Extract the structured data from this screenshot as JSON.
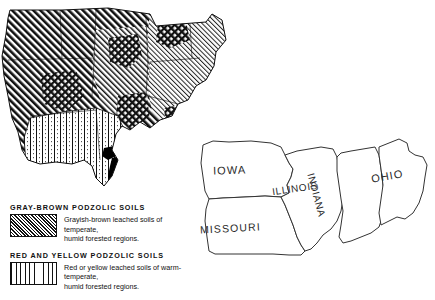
{
  "figure": {
    "kind": "soil-distribution-map",
    "ink_color": "#111111",
    "background_color": "#ffffff"
  },
  "main_map": {
    "name": "eastern-united-states-soil-map",
    "regions": [
      {
        "id": "gray-brown-podzolic",
        "pattern": "diagonal-hatch",
        "description": "dense diagonal hatching covering the upper midwest, great lakes, ohio valley, appalachian and northeastern area"
      },
      {
        "id": "red-yellow-podzolic",
        "pattern": "vertical-dotted-lines",
        "description": "vertical dotted line pattern covering the lower mississippi valley and southern area"
      },
      {
        "id": "alluvial-dark",
        "pattern": "solid-black",
        "description": "solid black strip along the lower mississippi river"
      }
    ]
  },
  "legend": {
    "entries": [
      {
        "heading": "GRAY-BROWN PODZOLIC  SOILS",
        "swatch": "diagonal-hatch-swatch",
        "line1": "Grayish-brown  leached  soils  of  temperate,",
        "line2": "humid  forested  regions."
      },
      {
        "heading": "RED  AND  YELLOW PODZOLIC SOILS",
        "swatch": "vertical-dotted-swatch",
        "line1": "Red or  yellow leached soils of warm-temperate,",
        "line2": "humid  forested  regions."
      }
    ]
  },
  "inset_map": {
    "name": "five-state-outline-inset",
    "states": [
      {
        "id": "iowa",
        "label": "IOWA"
      },
      {
        "id": "missouri",
        "label": "MISSOURI"
      },
      {
        "id": "illinois",
        "label": "ILLINOIS"
      },
      {
        "id": "indiana",
        "label": "INDIANA"
      },
      {
        "id": "ohio",
        "label": "OHIO"
      }
    ]
  }
}
